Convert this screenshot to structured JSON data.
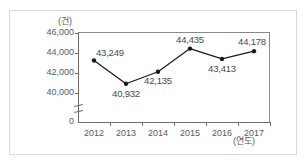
{
  "figure": {
    "top_bleed_text": "",
    "y_axis_unit": "(건)",
    "x_axis_unit": "(연도)"
  },
  "chart_data": {
    "type": "line",
    "title": "",
    "xlabel": "(연도)",
    "ylabel": "(건)",
    "categories": [
      "2012",
      "2013",
      "2014",
      "2015",
      "2016",
      "2017"
    ],
    "values": [
      43249,
      40932,
      42135,
      44435,
      43413,
      44178
    ],
    "value_labels": [
      "43,249",
      "40,932",
      "42,135",
      "44,435",
      "43,413",
      "44,178"
    ],
    "ytick_labels": [
      "46,000",
      "44,000",
      "42,000",
      "40,000",
      "0"
    ],
    "ytick_values": [
      46000,
      44000,
      42000,
      40000,
      0
    ],
    "ylim": [
      39000,
      46000
    ],
    "y_axis_broken": true,
    "grid": false,
    "legend": "none",
    "series_color": "#1a1a1a",
    "marker": "filled-circle"
  }
}
